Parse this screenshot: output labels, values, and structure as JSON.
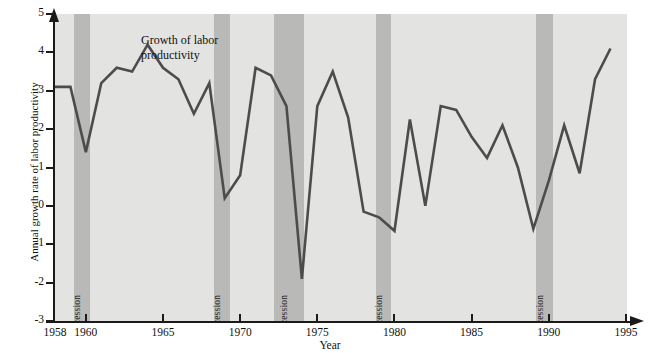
{
  "chart_data": {
    "type": "line",
    "title": "",
    "xlabel": "Year",
    "ylabel": "Annual growth rate of labor productivity",
    "xlim": [
      1958,
      1995
    ],
    "ylim": [
      -3,
      5
    ],
    "grid": false,
    "legend_position": "inline-annotation",
    "series_annotation": "Growth of labor productivity",
    "ytick_labels": [
      "5",
      "4",
      "3",
      "2",
      "1",
      "0",
      "-1",
      "-2",
      "-3"
    ],
    "ytick_values": [
      5,
      4,
      3,
      2,
      1,
      0,
      -1,
      -2,
      -3
    ],
    "xtick_labels": [
      "1958",
      "1960",
      "1965",
      "1970",
      "1975",
      "1980",
      "1985",
      "1990",
      "1995"
    ],
    "xtick_values": [
      1958,
      1960,
      1965,
      1970,
      1975,
      1980,
      1985,
      1990,
      1995
    ],
    "x": [
      1958,
      1959,
      1960,
      1961,
      1962,
      1963,
      1964,
      1965,
      1966,
      1967,
      1968,
      1969,
      1970,
      1971,
      1972,
      1973,
      1974,
      1975,
      1976,
      1977,
      1978,
      1979,
      1980,
      1981,
      1982,
      1983,
      1984,
      1985,
      1986,
      1987,
      1988,
      1989,
      1990,
      1991,
      1992,
      1993,
      1994
    ],
    "series": [
      {
        "name": "Growth of labor productivity",
        "color": "#4c4c4c",
        "values": [
          3.1,
          3.1,
          1.4,
          3.2,
          3.6,
          3.5,
          4.2,
          3.6,
          3.3,
          2.4,
          3.2,
          0.2,
          0.8,
          3.6,
          3.4,
          2.6,
          -1.9,
          2.6,
          3.5,
          2.3,
          -0.15,
          -0.3,
          -0.65,
          2.25,
          0.0,
          2.6,
          2.5,
          1.8,
          1.25,
          2.1,
          1.0,
          -0.6,
          0.65,
          2.1,
          0.85,
          3.3,
          4.1
        ]
      }
    ],
    "shaded_regions": [
      {
        "label": "Recession",
        "start": 1959.2,
        "end": 1960.25,
        "color": "#b9b9b7"
      },
      {
        "label": "Recession",
        "start": 1968.3,
        "end": 1969.35,
        "color": "#b9b9b7"
      },
      {
        "label": "Recession",
        "start": 1972.2,
        "end": 1974.15,
        "color": "#b9b9b7"
      },
      {
        "label": "Recession",
        "start": 1978.8,
        "end": 1979.8,
        "color": "#b9b9b7"
      },
      {
        "label": "Recession",
        "start": 1989.2,
        "end": 1990.25,
        "color": "#b9b9b7"
      }
    ],
    "plot_background": "#e3e3e1",
    "axis_color": "#1a1a1a"
  }
}
